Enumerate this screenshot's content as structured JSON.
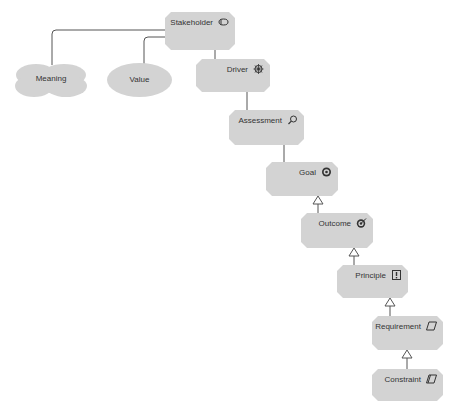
{
  "diagram": {
    "type": "ArchiMate motivation view",
    "nodes": {
      "stakeholder": {
        "label": "Stakeholder",
        "icon": "stakeholder-icon"
      },
      "meaning": {
        "label": "Meaning",
        "icon": "cloud-shape"
      },
      "value": {
        "label": "Value",
        "icon": "ellipse-shape"
      },
      "driver": {
        "label": "Driver",
        "icon": "driver-icon"
      },
      "assessment": {
        "label": "Assessment",
        "icon": "magnifier-icon"
      },
      "goal": {
        "label": "Goal",
        "icon": "target-icon"
      },
      "outcome": {
        "label": "Outcome",
        "icon": "target-arrow-icon"
      },
      "principle": {
        "label": "Principle",
        "icon": "exclamation-box-icon"
      },
      "requirement": {
        "label": "Requirement",
        "icon": "parallelogram-icon"
      },
      "constraint": {
        "label": "Constraint",
        "icon": "parallelogram-lines-icon"
      }
    },
    "connections": [
      {
        "from": "stakeholder",
        "to": "meaning",
        "type": "association"
      },
      {
        "from": "stakeholder",
        "to": "value",
        "type": "association"
      },
      {
        "from": "stakeholder",
        "to": "driver",
        "type": "association"
      },
      {
        "from": "driver",
        "to": "assessment",
        "type": "association"
      },
      {
        "from": "assessment",
        "to": "goal",
        "type": "association"
      },
      {
        "from": "outcome",
        "to": "goal",
        "type": "realization"
      },
      {
        "from": "principle",
        "to": "outcome",
        "type": "realization"
      },
      {
        "from": "requirement",
        "to": "principle",
        "type": "realization"
      },
      {
        "from": "constraint",
        "to": "requirement",
        "type": "realization"
      }
    ],
    "colors": {
      "node_fill": "#d3d3d3",
      "line": "#555555",
      "text": "#333333"
    }
  }
}
